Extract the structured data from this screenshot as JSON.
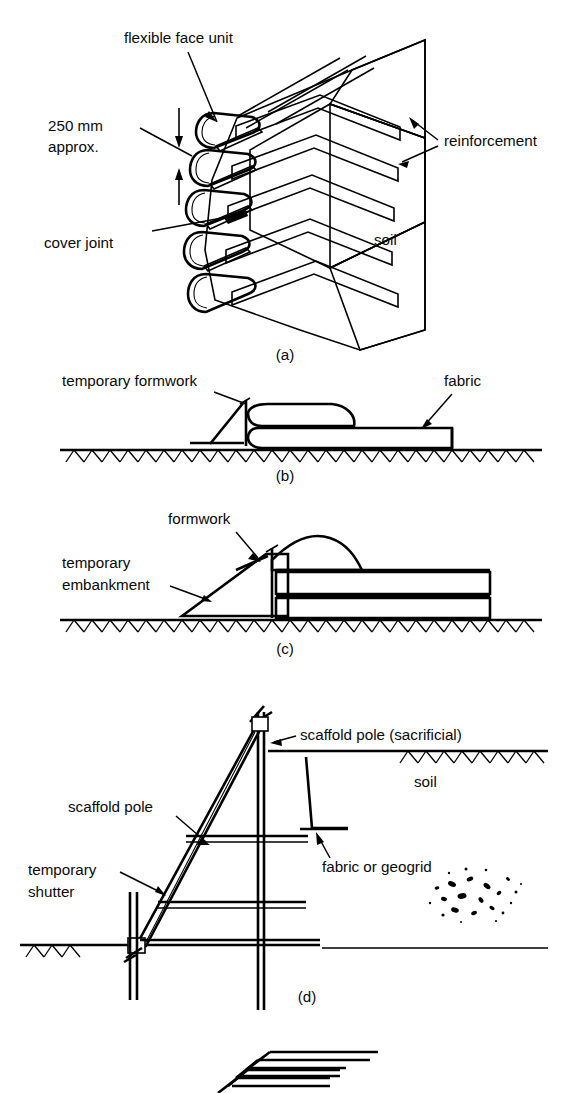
{
  "figure": {
    "background_color": "#ffffff",
    "line_color": "#000000",
    "panels": [
      {
        "id": "a",
        "caption": "(a)",
        "description": "Isometric cut-away of a wrapped-around flexible faced reinforced soil wall",
        "labels": [
          {
            "name": "flexible-face-unit",
            "text": "flexible face unit"
          },
          {
            "name": "dimension-250mm",
            "text": "250 mm"
          },
          {
            "name": "dimension-approx",
            "text": "approx."
          },
          {
            "name": "cover-joint",
            "text": "cover joint"
          },
          {
            "name": "reinforcement",
            "text": "reinforcement"
          },
          {
            "name": "soil",
            "text": "soil"
          }
        ]
      },
      {
        "id": "b",
        "caption": "(b)",
        "description": "Section through fabric wrapped layer formed against temporary formwork",
        "labels": [
          {
            "name": "temporary-formwork",
            "text": "temporary formwork"
          },
          {
            "name": "fabric",
            "text": "fabric"
          }
        ]
      },
      {
        "id": "c",
        "caption": "(c)",
        "description": "Section showing layers formed against a temporary embankment with formwork",
        "labels": [
          {
            "name": "formwork",
            "text": "formwork"
          },
          {
            "name": "temporary-embankment-line1",
            "text": "temporary"
          },
          {
            "name": "temporary-embankment-line2",
            "text": "embankment"
          }
        ]
      },
      {
        "id": "d",
        "caption": "(d)",
        "description": "Section showing scaffold pole frame supporting temporary shutter with fabric or geogrid layers",
        "labels": [
          {
            "name": "scaffold-pole-sacrificial",
            "text": "scaffold pole (sacrificial)"
          },
          {
            "name": "soil",
            "text": "soil"
          },
          {
            "name": "scaffold-pole",
            "text": "scaffold pole"
          },
          {
            "name": "fabric-or-geogrid",
            "text": "fabric or geogrid"
          },
          {
            "name": "temporary-shutter-line1",
            "text": "temporary"
          },
          {
            "name": "temporary-shutter-line2",
            "text": "shutter"
          }
        ]
      },
      {
        "id": "e",
        "caption": "",
        "description": "Partially visible isometric outline of stacked wrapped reinforcement layers at page foot",
        "labels": []
      }
    ]
  }
}
